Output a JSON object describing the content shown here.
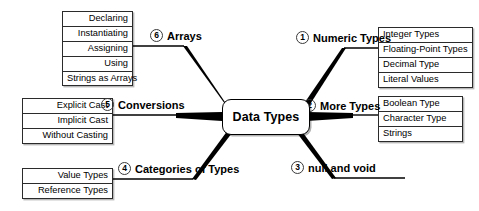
{
  "diagram": {
    "title": "Data Types",
    "center_label": "Data Types",
    "type": "mind-map",
    "branch_count": 6,
    "colors": {
      "line": "#000000",
      "box_border": "#2b2b2b",
      "background": "#ffffff"
    },
    "branches": [
      {
        "number": "1",
        "label": "Numeric Types",
        "side": "right",
        "leaves": [
          "Integer Types",
          "Floating-Point Types",
          "Decimal Type",
          "Literal Values"
        ]
      },
      {
        "number": "2",
        "label": "More Types",
        "side": "right",
        "leaves": [
          "Boolean Type",
          "Character Type",
          "Strings"
        ]
      },
      {
        "number": "3",
        "label": "null and void",
        "side": "right",
        "leaves": []
      },
      {
        "number": "4",
        "label": "Categories of Types",
        "side": "left",
        "leaves": [
          "Value Types",
          "Reference Types"
        ]
      },
      {
        "number": "5",
        "label": "Conversions",
        "side": "left",
        "leaves": [
          "Explicit Cast",
          "Implicit Cast",
          "Without Casting"
        ]
      },
      {
        "number": "6",
        "label": "Arrays",
        "side": "left",
        "leaves": [
          "Declaring",
          "Instantiating",
          "Assigning",
          "Using",
          "Strings as Arrays"
        ]
      }
    ]
  }
}
